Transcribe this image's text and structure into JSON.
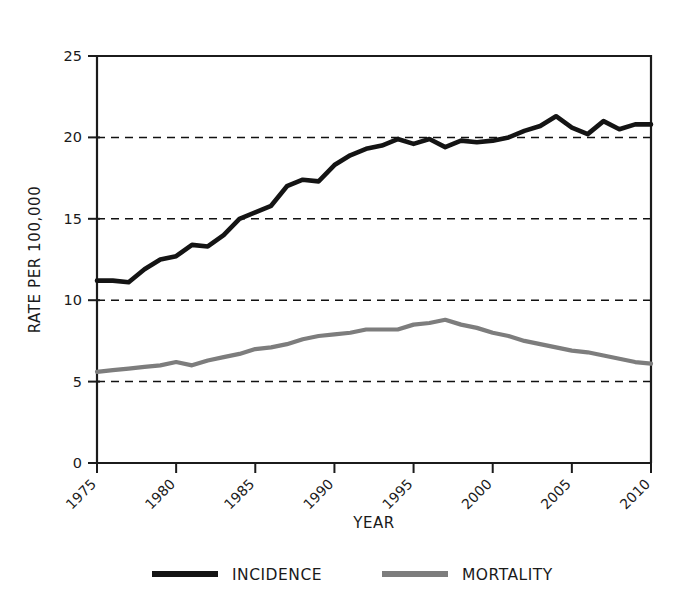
{
  "chart_data": {
    "type": "line",
    "title": "",
    "xlabel": "YEAR",
    "ylabel": "RATE PER 100,000",
    "xlim": [
      1975,
      2010
    ],
    "ylim": [
      0,
      25
    ],
    "xticks": [
      1975,
      1980,
      1985,
      1990,
      1995,
      2000,
      2005,
      2010
    ],
    "xtick_labels": [
      "1975",
      "1980",
      "1985",
      "1990",
      "1995",
      "2000",
      "2005",
      "2010"
    ],
    "yticks": [
      0,
      5,
      10,
      15,
      20,
      25
    ],
    "ytick_labels": [
      "0",
      "5",
      "10",
      "15",
      "20",
      "25"
    ],
    "grid": "horizontal-dashed",
    "legend_position": "bottom",
    "x": [
      1975,
      1976,
      1977,
      1978,
      1979,
      1980,
      1981,
      1982,
      1983,
      1984,
      1985,
      1986,
      1987,
      1988,
      1989,
      1990,
      1991,
      1992,
      1993,
      1994,
      1995,
      1996,
      1997,
      1998,
      1999,
      2000,
      2001,
      2002,
      2003,
      2004,
      2005,
      2006,
      2007,
      2008,
      2009,
      2010
    ],
    "series": [
      {
        "name": "INCIDENCE",
        "color": "#141414",
        "values": [
          11.2,
          11.2,
          11.1,
          11.9,
          12.5,
          12.7,
          13.4,
          13.3,
          14.0,
          15.0,
          15.4,
          15.8,
          17.0,
          17.4,
          17.3,
          18.3,
          18.9,
          19.3,
          19.5,
          19.9,
          19.6,
          19.9,
          19.4,
          19.8,
          19.7,
          19.8,
          20.0,
          20.4,
          20.7,
          21.3,
          20.6,
          20.2,
          21.0,
          20.5,
          20.8,
          20.8
        ]
      },
      {
        "name": "MORTALITY",
        "color": "#7d7d7d",
        "values": [
          5.6,
          5.7,
          5.8,
          5.9,
          6.0,
          6.2,
          6.0,
          6.3,
          6.5,
          6.7,
          7.0,
          7.1,
          7.3,
          7.6,
          7.8,
          7.9,
          8.0,
          8.2,
          8.2,
          8.2,
          8.5,
          8.6,
          8.8,
          8.5,
          8.3,
          8.0,
          7.8,
          7.5,
          7.3,
          7.1,
          6.9,
          6.8,
          6.6,
          6.4,
          6.2,
          6.1
        ]
      }
    ]
  },
  "legend": {
    "entries": [
      {
        "label": "INCIDENCE",
        "color": "#141414"
      },
      {
        "label": "MORTALITY",
        "color": "#7d7d7d"
      }
    ]
  }
}
